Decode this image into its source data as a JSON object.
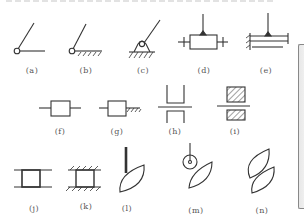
{
  "figure": {
    "stroke_color": "#333333",
    "label_color": "#555555",
    "symbols": [
      {
        "id": "a",
        "label": "(a)",
        "description": "rotating pair link with pivot, free"
      },
      {
        "id": "b",
        "label": "(b)",
        "description": "link pivoted to ground (hatched)"
      },
      {
        "id": "c",
        "label": "(c)",
        "description": "link on fixed hinge support"
      },
      {
        "id": "d",
        "label": "(d)",
        "description": "slider block on guide rod with link"
      },
      {
        "id": "e",
        "label": "(e)",
        "description": "slider on fixed guide with link"
      },
      {
        "id": "f",
        "label": "(f)",
        "description": "slider block on rod"
      },
      {
        "id": "g",
        "label": "(g)",
        "description": "slider block on rod, fixed end"
      },
      {
        "id": "h",
        "label": "(h)",
        "description": "sliding pair, channel guides"
      },
      {
        "id": "i",
        "label": "(i)",
        "description": "sliding pair, fixed hatched guides"
      },
      {
        "id": "j",
        "label": "(j)",
        "description": "block between parallel guides"
      },
      {
        "id": "k",
        "label": "(k)",
        "description": "block between fixed parallel guides"
      },
      {
        "id": "l",
        "label": "(l)",
        "description": "cam with flat/knife follower"
      },
      {
        "id": "m",
        "label": "(m)",
        "description": "cam with roller follower"
      },
      {
        "id": "n",
        "label": "(n)",
        "description": "cam pair contact"
      }
    ]
  }
}
